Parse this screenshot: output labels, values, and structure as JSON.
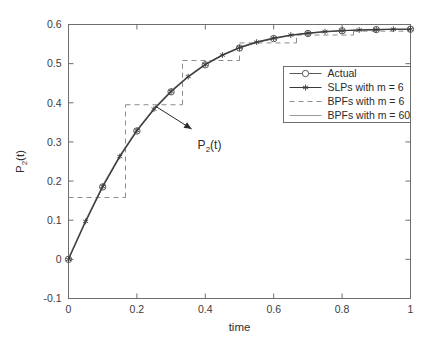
{
  "figure": {
    "background_color": "#ffffff",
    "axes_color": "#6e6e6e",
    "width": 433,
    "height": 349
  },
  "axes": {
    "xlabel": "time",
    "ylabel_main": "P",
    "ylabel_sub": "2",
    "ylabel_tail": "(t)",
    "ylabel_full": "P_2(t)",
    "xticks": [
      "0",
      "0.2",
      "0.4",
      "0.6",
      "0.8",
      "1"
    ],
    "xtick_values": [
      0,
      0.2,
      0.4,
      0.6,
      0.8,
      1
    ],
    "yticks": [
      "-0.1",
      "0",
      "0.1",
      "0.2",
      "0.3",
      "0.4",
      "0.5",
      "0.6"
    ],
    "ytick_values": [
      -0.1,
      0,
      0.1,
      0.2,
      0.3,
      0.4,
      0.5,
      0.6
    ],
    "xlim": [
      0,
      1
    ],
    "ylim": [
      -0.1,
      0.6
    ]
  },
  "annotation": {
    "text_main": "P",
    "text_sub": "2",
    "text_tail": "(t)",
    "text_full": "P_2(t)",
    "arrow_from": [
      0.36,
      0.333
    ],
    "arrow_to": [
      0.253,
      0.392
    ]
  },
  "legend": {
    "position": "center-right",
    "entries": [
      {
        "label": "Actual",
        "style": "line-circle",
        "color": "#5a5a5a"
      },
      {
        "label": "SLPs with m = 6",
        "style": "line-asterisk",
        "color": "#3a3a3a"
      },
      {
        "label": "BPFs with m = 6",
        "style": "dashed",
        "color": "#8c8c8c"
      },
      {
        "label": "BPFs with m = 60",
        "style": "solid-light",
        "color": "#9a9a9a"
      }
    ]
  },
  "chart_data": {
    "type": "line",
    "title": "",
    "xlabel": "time",
    "ylabel": "P_2(t)",
    "xlim": [
      0,
      1
    ],
    "ylim": [
      -0.1,
      0.6
    ],
    "grid": false,
    "legend_position": "center-right",
    "series": [
      {
        "name": "Actual",
        "style": "solid-with-open-circles",
        "marker": "circle",
        "color": "#5a5a5a",
        "x": [
          0,
          0.05,
          0.1,
          0.15,
          0.2,
          0.25,
          0.3,
          0.35,
          0.4,
          0.45,
          0.5,
          0.55,
          0.6,
          0.65,
          0.7,
          0.75,
          0.8,
          0.85,
          0.9,
          0.95,
          1
        ],
        "y": [
          0,
          0.096,
          0.185,
          0.262,
          0.328,
          0.383,
          0.428,
          0.466,
          0.497,
          0.521,
          0.54,
          0.554,
          0.564,
          0.572,
          0.577,
          0.581,
          0.584,
          0.586,
          0.587,
          0.588,
          0.588
        ]
      },
      {
        "name": "SLPs with m = 6",
        "style": "solid-with-asterisks",
        "marker": "asterisk",
        "color": "#3a3a3a",
        "x": [
          0,
          0.05,
          0.1,
          0.15,
          0.2,
          0.25,
          0.3,
          0.35,
          0.4,
          0.45,
          0.5,
          0.55,
          0.6,
          0.65,
          0.7,
          0.75,
          0.8,
          0.85,
          0.9,
          0.95,
          1
        ],
        "y": [
          0,
          0.097,
          0.186,
          0.263,
          0.329,
          0.384,
          0.429,
          0.467,
          0.498,
          0.522,
          0.541,
          0.555,
          0.565,
          0.573,
          0.578,
          0.582,
          0.584,
          0.586,
          0.587,
          0.588,
          0.588
        ]
      },
      {
        "name": "BPFs with m = 6",
        "style": "dashed-staircase",
        "marker": "none",
        "color": "#8c8c8c",
        "step_edges": [
          0,
          0.16667,
          0.33333,
          0.5,
          0.66667,
          0.83333,
          1
        ],
        "step_values": [
          0.158,
          0.395,
          0.508,
          0.553,
          0.573,
          0.583
        ]
      },
      {
        "name": "BPFs with m = 60",
        "style": "solid-light",
        "marker": "none",
        "color": "#9a9a9a",
        "x": [
          0,
          0.05,
          0.1,
          0.15,
          0.2,
          0.25,
          0.3,
          0.35,
          0.4,
          0.45,
          0.5,
          0.55,
          0.6,
          0.65,
          0.7,
          0.75,
          0.8,
          0.85,
          0.9,
          0.95,
          1
        ],
        "y": [
          0.004,
          0.1,
          0.189,
          0.265,
          0.331,
          0.386,
          0.431,
          0.468,
          0.499,
          0.523,
          0.542,
          0.556,
          0.566,
          0.573,
          0.578,
          0.582,
          0.585,
          0.586,
          0.587,
          0.588,
          0.588
        ]
      }
    ]
  }
}
